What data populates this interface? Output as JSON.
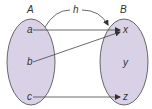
{
  "diagram": {
    "type": "function-mapping",
    "function_label": "h",
    "colors": {
      "set_fill": "#d9d2e6",
      "stroke": "#555555",
      "text": "#333333"
    },
    "sets": [
      {
        "name": "A",
        "elements": [
          "a",
          "b",
          "c"
        ]
      },
      {
        "name": "B",
        "elements": [
          "x",
          "y",
          "z"
        ]
      }
    ],
    "mappings": [
      {
        "from": "a",
        "to": "x"
      },
      {
        "from": "b",
        "to": "x"
      },
      {
        "from": "c",
        "to": "z"
      }
    ]
  }
}
